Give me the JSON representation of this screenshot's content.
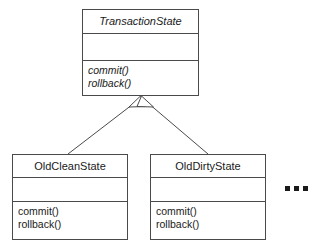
{
  "diagram": {
    "type": "uml-class-diagram",
    "notation": "UML generalization (inheritance)",
    "classes": [
      {
        "id": "transaction-state",
        "name": "TransactionState",
        "abstract": true,
        "attributes": [],
        "operations": [
          {
            "label": "commit()",
            "abstract": true
          },
          {
            "label": "rollback()",
            "abstract": true
          }
        ]
      },
      {
        "id": "old-clean-state",
        "name": "OldCleanState",
        "abstract": false,
        "attributes": [],
        "operations": [
          {
            "label": "commit()",
            "abstract": false
          },
          {
            "label": "rollback()",
            "abstract": false
          }
        ]
      },
      {
        "id": "old-dirty-state",
        "name": "OldDirtyState",
        "abstract": false,
        "attributes": [],
        "operations": [
          {
            "label": "commit()",
            "abstract": false
          },
          {
            "label": "rollback()",
            "abstract": false
          }
        ]
      }
    ],
    "relationships": [
      {
        "from": "OldCleanState",
        "to": "TransactionState",
        "kind": "generalization"
      },
      {
        "from": "OldDirtyState",
        "to": "TransactionState",
        "kind": "generalization"
      }
    ],
    "ellipsis": {
      "label": "...",
      "meaning": "more subclasses"
    },
    "colors": {
      "stroke": "#4a4a4a",
      "text": "#1a1a1a",
      "fill": "#ffffff",
      "background": "#ffffff"
    }
  }
}
